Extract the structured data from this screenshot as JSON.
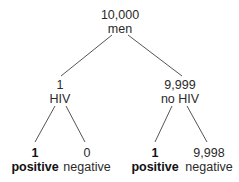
{
  "tree": {
    "root": {
      "count": "10,000",
      "label": "men"
    },
    "left": {
      "count": "1",
      "label": "HIV"
    },
    "right": {
      "count": "9,999",
      "label": "no HIV"
    },
    "leaves": [
      {
        "count": "1",
        "label": "positive",
        "bold": true
      },
      {
        "count": "0",
        "label": "negative",
        "bold": false
      },
      {
        "count": "1",
        "label": "positive",
        "bold": true
      },
      {
        "count": "9,998",
        "label": "negative",
        "bold": false
      }
    ]
  },
  "colors": {
    "line": "#555555",
    "text": "#2a2a2a",
    "bold_text": "#111111"
  }
}
